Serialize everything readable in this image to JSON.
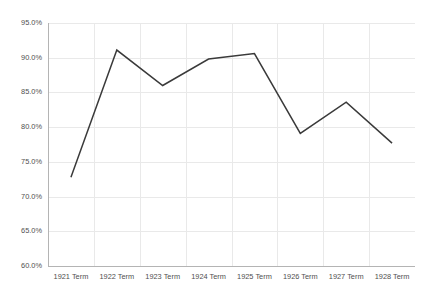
{
  "chart_data": {
    "type": "line",
    "title": "",
    "subtitle": "",
    "xlabel": "",
    "ylabel": "",
    "categories": [
      "1921 Term",
      "1922 Term",
      "1923 Term",
      "1924 Term",
      "1925 Term",
      "1926 Term",
      "1927 Term",
      "1928 Term"
    ],
    "series": [
      {
        "name": "",
        "values": [
          72.8,
          91.1,
          86.0,
          89.8,
          90.6,
          79.1,
          83.6,
          77.7
        ],
        "color": "#3a3a3a"
      }
    ],
    "ylim": [
      60.0,
      95.0
    ],
    "ytick_values": [
      60.0,
      65.0,
      70.0,
      75.0,
      80.0,
      85.0,
      90.0,
      95.0
    ],
    "ytick_labels": [
      "60.0%",
      "65.0%",
      "70.0%",
      "75.0%",
      "80.0%",
      "85.0%",
      "90.0%",
      "95.0%"
    ],
    "y_axis_format": "percent",
    "grid": {
      "horizontal": true,
      "vertical": true,
      "color": "#e9e9e9"
    },
    "legend": {
      "visible": false,
      "position": "none",
      "entries": []
    },
    "annotations": [],
    "background_color": "#ffffff",
    "axis_color": "#b4b4b4",
    "label_color": "#4f4f4f"
  },
  "layout": {
    "plot_left": 48,
    "plot_right": 415,
    "plot_top": 23,
    "plot_bottom": 266,
    "canvas_width": 435,
    "canvas_height": 297
  }
}
